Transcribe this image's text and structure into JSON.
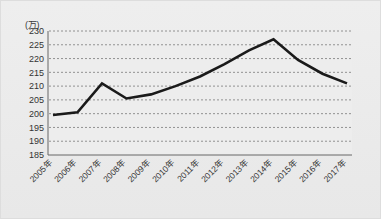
{
  "chart_data": {
    "type": "line",
    "title": "",
    "subtitle": "",
    "unit_label": "(万)",
    "xlabel": "",
    "ylabel": "",
    "ylim": [
      185,
      230
    ],
    "ytick_step": 5,
    "yticks": [
      230,
      225,
      220,
      215,
      210,
      205,
      200,
      195,
      190,
      185
    ],
    "grid": true,
    "grid_style": "dashed-horizontal",
    "legend": false,
    "legend_position": "none",
    "categories": [
      "2005年",
      "2006年",
      "2007年",
      "2008年",
      "2009年",
      "2010年",
      "2011年",
      "2012年",
      "2013年",
      "2014年",
      "2015年",
      "2016年",
      "2017年"
    ],
    "xtick_rotation": -45,
    "series": [
      {
        "name": "series-1",
        "color": "#1a1a1a",
        "line_width": 2.6,
        "values": [
          199.5,
          200.5,
          211.0,
          205.5,
          207.0,
          210.0,
          213.5,
          218.0,
          223.0,
          227.0,
          219.5,
          214.5,
          211.0
        ]
      }
    ],
    "annotations": []
  },
  "colors": {
    "background": "#ebebeb",
    "plot_background": "#ededed",
    "axis": "#555555",
    "grid": "#7a7a7a",
    "line": "#1a1a1a",
    "text": "#333333"
  }
}
